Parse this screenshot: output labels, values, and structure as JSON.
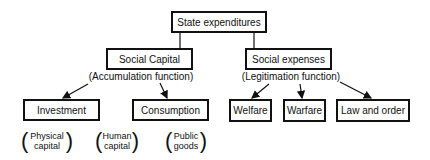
{
  "diagram": {
    "root": {
      "label": "State expenditures"
    },
    "branches": [
      {
        "label": "Social Capital",
        "function": "(Accumulation function)",
        "children": [
          {
            "label": "Investment",
            "note_line1": "Physical",
            "note_line2": "capital"
          },
          {
            "label": "Consumption"
          }
        ],
        "extra_notes": [
          {
            "line1": "Human",
            "line2": "capital"
          },
          {
            "line1": "Public",
            "line2": "goods"
          }
        ]
      },
      {
        "label": "Social expenses",
        "function": "(Legitimation function)",
        "children": [
          {
            "label": "Welfare"
          },
          {
            "label": "Warfare"
          },
          {
            "label": "Law and order"
          }
        ]
      }
    ],
    "colors": {
      "stroke": "#111111",
      "background": "#ffffff"
    }
  }
}
